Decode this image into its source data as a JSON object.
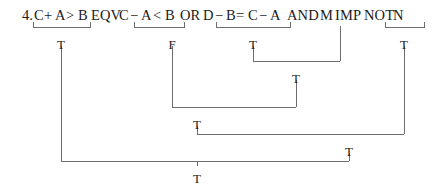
{
  "problem": {
    "number": "4.",
    "expression_text": "C + A > B EQV C - A < B OR D - B = C - A AND M IMP NOT N"
  },
  "expression_tokens": [
    {
      "text": "4.",
      "x": 22
    },
    {
      "text": "C",
      "x": 34
    },
    {
      "text": "+",
      "x": 44
    },
    {
      "text": "A",
      "x": 55
    },
    {
      "text": ">",
      "x": 66
    },
    {
      "text": "B",
      "x": 78
    },
    {
      "text": "EQV",
      "x": 91
    },
    {
      "text": "C",
      "x": 119
    },
    {
      "text": "−",
      "x": 130
    },
    {
      "text": "A",
      "x": 141
    },
    {
      "text": "<",
      "x": 153
    },
    {
      "text": "B",
      "x": 165
    },
    {
      "text": "OR",
      "x": 180
    },
    {
      "text": "D",
      "x": 203
    },
    {
      "text": "−",
      "x": 215
    },
    {
      "text": "B",
      "x": 226
    },
    {
      "text": "=",
      "x": 236
    },
    {
      "text": "C",
      "x": 248
    },
    {
      "text": "−",
      "x": 259
    },
    {
      "text": "A",
      "x": 270
    },
    {
      "text": "AND",
      "x": 287
    },
    {
      "text": "M",
      "x": 320
    },
    {
      "text": "IMP",
      "x": 335
    },
    {
      "text": "NOT",
      "x": 364
    },
    {
      "text": "N",
      "x": 393
    }
  ],
  "chart_data": {
    "type": "diagram",
    "brackets": [
      {
        "id": "bracket-relational-1",
        "covers": "C + A > B",
        "x1": 33,
        "x2": 90,
        "y": 27,
        "result": "T",
        "result_x": 61,
        "result_y": 38
      },
      {
        "id": "bracket-relational-2",
        "covers": "C - A < B",
        "x1": 134,
        "x2": 184,
        "y": 27,
        "result": "F",
        "result_x": 172,
        "result_y": 38
      },
      {
        "id": "bracket-relational-3",
        "covers": "D - B = C - A",
        "x1": 216,
        "x2": 290,
        "y": 27,
        "result": "T",
        "result_x": 253,
        "result_y": 38
      },
      {
        "id": "bracket-not",
        "covers": "NOT N",
        "x1": 385,
        "x2": 424,
        "y": 27,
        "result": "T",
        "result_x": 404,
        "result_y": 38
      }
    ],
    "joins": [
      {
        "id": "join-and",
        "operator": "AND",
        "left_x": 253,
        "right_x": 340,
        "y": 61,
        "result": "T",
        "result_x": 296,
        "result_y": 72
      },
      {
        "id": "join-or",
        "operator": "OR",
        "left_x": 172,
        "right_x": 296,
        "y": 107,
        "result": "T",
        "result_x": 197,
        "result_y": 118
      },
      {
        "id": "join-imp",
        "operator": "IMP",
        "left_x": 197,
        "right_x": 404,
        "y": 134,
        "result": "T",
        "result_x": 349,
        "result_y": 145
      },
      {
        "id": "join-eqv",
        "operator": "EQV",
        "left_x": 61,
        "right_x": 349,
        "y": 161,
        "result": "T",
        "result_x": 197,
        "result_y": 172
      }
    ],
    "operand_drops": [
      {
        "id": "drop-m",
        "label": "M",
        "x": 340,
        "y_top": 26,
        "y_bottom": 61
      }
    ],
    "values_in_order": [
      "T",
      "F",
      "T",
      "T",
      "T",
      "T",
      "T",
      "T"
    ],
    "final_result": "T"
  },
  "colors": {
    "line": "#6d6d6d",
    "text": "#1b1b1b",
    "background": "#ffffff"
  }
}
